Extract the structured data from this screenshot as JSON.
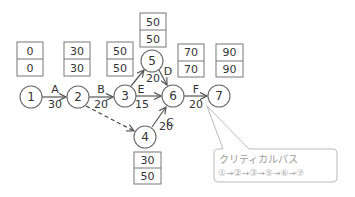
{
  "diagram": {
    "type": "pert-arrow-diagram",
    "nodes": [
      {
        "id": "1",
        "label": "1",
        "x": 31,
        "y": 97,
        "earliest": "0",
        "latest": "0",
        "box_x": 17,
        "box_y": 42,
        "box_pos": "above"
      },
      {
        "id": "2",
        "label": "2",
        "x": 78,
        "y": 97,
        "earliest": "30",
        "latest": "30",
        "box_x": 64,
        "box_y": 42,
        "box_pos": "above"
      },
      {
        "id": "3",
        "label": "3",
        "x": 125,
        "y": 96,
        "earliest": "50",
        "latest": "50",
        "box_x": 107,
        "box_y": 42,
        "box_pos": "above"
      },
      {
        "id": "4",
        "label": "4",
        "x": 145,
        "y": 137,
        "earliest": "30",
        "latest": "50",
        "box_x": 134,
        "box_y": 152,
        "box_pos": "below"
      },
      {
        "id": "5",
        "label": "5",
        "x": 152,
        "y": 61,
        "earliest": "50",
        "latest": "50",
        "box_x": 140,
        "box_y": 14,
        "box_pos": "above"
      },
      {
        "id": "6",
        "label": "6",
        "x": 173,
        "y": 96,
        "earliest": "70",
        "latest": "70",
        "box_x": 178,
        "box_y": 44,
        "box_pos": "above"
      },
      {
        "id": "7",
        "label": "7",
        "x": 219,
        "y": 96,
        "earliest": "90",
        "latest": "90",
        "box_x": 216,
        "box_y": 44,
        "box_pos": "above"
      }
    ],
    "activities": [
      {
        "name": "A",
        "from": "1",
        "to": "2",
        "duration": "30"
      },
      {
        "name": "B",
        "from": "2",
        "to": "3",
        "duration": "20"
      },
      {
        "name": "C",
        "from": "4",
        "to": "6",
        "duration": "20"
      },
      {
        "name": "D",
        "from": "5",
        "to": "6",
        "duration": "20"
      },
      {
        "name": "E",
        "from": "3",
        "to": "6",
        "duration": "15"
      },
      {
        "name": "F",
        "from": "6",
        "to": "7",
        "duration": "20"
      },
      {
        "name": "",
        "from": "2",
        "to": "4",
        "duration": "",
        "dummy": true
      },
      {
        "name": "",
        "from": "3",
        "to": "5",
        "duration": ""
      }
    ],
    "callout": {
      "title": "クリティカルパス",
      "path": "①→②→③→⑤→⑥→⑦"
    },
    "colors": {
      "line": "#555555",
      "text": "#333333",
      "callout_border": "#bbbbbb",
      "callout_text": "#9a9a9a"
    }
  }
}
